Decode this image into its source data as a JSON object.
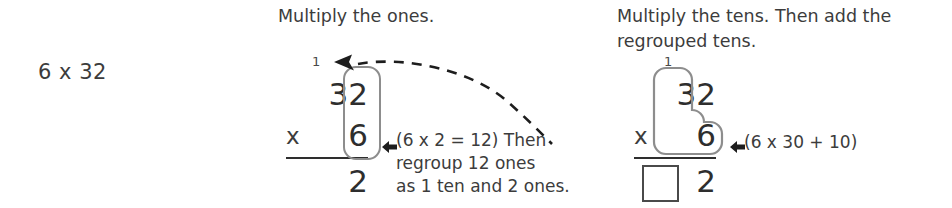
{
  "problem": {
    "label": "6 x 32"
  },
  "steps": [
    {
      "heading": "Multiply the ones.",
      "carry_digit": "1",
      "top_number": "32",
      "operator": "x",
      "bottom_number": "6",
      "answer": "2",
      "answer_blank": "",
      "annotation": "(6 x 2 = 12) Then\nregroup 12 ones\nas 1 ten and 2 ones.",
      "highlight": "ones-column"
    },
    {
      "heading": "Multiply the tens. Then add the\nregrouped tens.",
      "carry_digit": "1",
      "top_number": "32",
      "operator": "x",
      "bottom_number": "6",
      "answer": "2",
      "answer_blank": "",
      "annotation": "(6 x 30 + 10)",
      "highlight": "tens-column"
    }
  ],
  "icons": {
    "pointer_arrow": "left-arrow-icon",
    "regroup_arrow": "dashed-curved-arrow-icon"
  },
  "colors": {
    "text": "#3c3c3c",
    "digits": "#2e2e2e",
    "highlight_outline": "#8d8d8d",
    "rule": "#2e2e2e",
    "box_outline": "#4a4a4a",
    "background": "#ffffff"
  }
}
